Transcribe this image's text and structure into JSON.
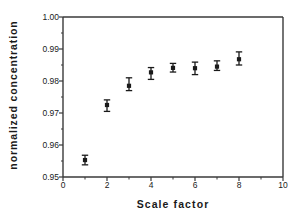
{
  "chart_data": {
    "type": "scatter",
    "title": "",
    "xlabel": "Scale  factor",
    "ylabel": "normalized  concentration",
    "xlim": [
      0,
      10
    ],
    "ylim": [
      0.95,
      1.0
    ],
    "xticks": [
      0,
      2,
      4,
      6,
      8,
      10
    ],
    "xtick_labels": [
      "0",
      "2",
      "4",
      "6",
      "8",
      "10"
    ],
    "xminor_ticks": [
      1,
      3,
      5,
      7,
      9
    ],
    "yticks": [
      0.95,
      0.96,
      0.97,
      0.98,
      0.99,
      1.0
    ],
    "ytick_labels": [
      "0.95",
      "0.96",
      "0.97",
      "0.98",
      "0.99",
      "1.00"
    ],
    "grid": false,
    "legend": "none",
    "marker": "square-filled",
    "marker_color": "#1a1a1a",
    "errorbar_style": "capped-vertical",
    "x": [
      1,
      2,
      3,
      4,
      5,
      6,
      7,
      8
    ],
    "y": [
      0.9553,
      0.9725,
      0.9785,
      0.9827,
      0.9841,
      0.984,
      0.9845,
      0.9868
    ],
    "yerr_lower": [
      0.0015,
      0.002,
      0.0015,
      0.0022,
      0.0013,
      0.002,
      0.0012,
      0.0018
    ],
    "yerr_upper": [
      0.0015,
      0.0016,
      0.0025,
      0.0015,
      0.0014,
      0.0019,
      0.0018,
      0.0023
    ],
    "points": [
      {
        "x": 1,
        "y": 0.9553,
        "low": 0.9538,
        "high": 0.9568
      },
      {
        "x": 2,
        "y": 0.9725,
        "low": 0.9705,
        "high": 0.9741
      },
      {
        "x": 3,
        "y": 0.9785,
        "low": 0.977,
        "high": 0.981
      },
      {
        "x": 4,
        "y": 0.9827,
        "low": 0.9805,
        "high": 0.9842
      },
      {
        "x": 5,
        "y": 0.9841,
        "low": 0.9828,
        "high": 0.9855
      },
      {
        "x": 6,
        "y": 0.984,
        "low": 0.982,
        "high": 0.9859
      },
      {
        "x": 7,
        "y": 0.9845,
        "low": 0.9833,
        "high": 0.9863
      },
      {
        "x": 8,
        "y": 0.9868,
        "low": 0.985,
        "high": 0.9891
      }
    ],
    "axis_color": "#3a3a3a",
    "background": "#ffffff"
  },
  "axes": {
    "x_label": "Scale  factor",
    "y_label": "normalized  concentration"
  }
}
